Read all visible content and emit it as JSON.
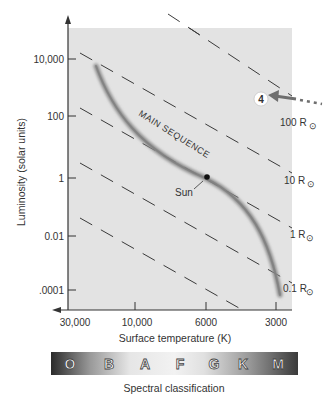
{
  "diagram": {
    "y_axis": {
      "label": "Luminosity (solar units)",
      "ticks": [
        {
          "label": "10,000",
          "y": 59
        },
        {
          "label": "100",
          "y": 116
        },
        {
          "label": "1",
          "y": 178
        },
        {
          "label": "0.01",
          "y": 236
        },
        {
          "label": ".0001",
          "y": 290
        }
      ]
    },
    "x_axis": {
      "label": "Surface temperature (K)",
      "ticks": [
        {
          "label": "30,000",
          "x": 68
        },
        {
          "label": "10,000",
          "x": 135
        },
        {
          "label": "6000",
          "x": 206
        },
        {
          "label": "3000",
          "x": 276
        }
      ]
    },
    "main_sequence_label": "MAIN SEQUENCE",
    "sun_label": "Sun",
    "radius_lines": [
      {
        "label": "100 R",
        "symbol": "⊙"
      },
      {
        "label": "10 R",
        "symbol": "⊙"
      },
      {
        "label": "1 R",
        "symbol": "⊙"
      },
      {
        "label": "0.1 R",
        "symbol": "⊙"
      }
    ],
    "callout": {
      "number": "4"
    },
    "spectral": {
      "label": "Spectral classification",
      "classes": [
        "O",
        "B",
        "A",
        "F",
        "G",
        "K",
        "M"
      ]
    },
    "colors": {
      "plot_bg": "#e3e3e3",
      "axis": "#333333",
      "dash": "#3a3a3a",
      "main_sequence": "#8a8a8a",
      "callout_arrow": "#6e6e6e"
    }
  }
}
